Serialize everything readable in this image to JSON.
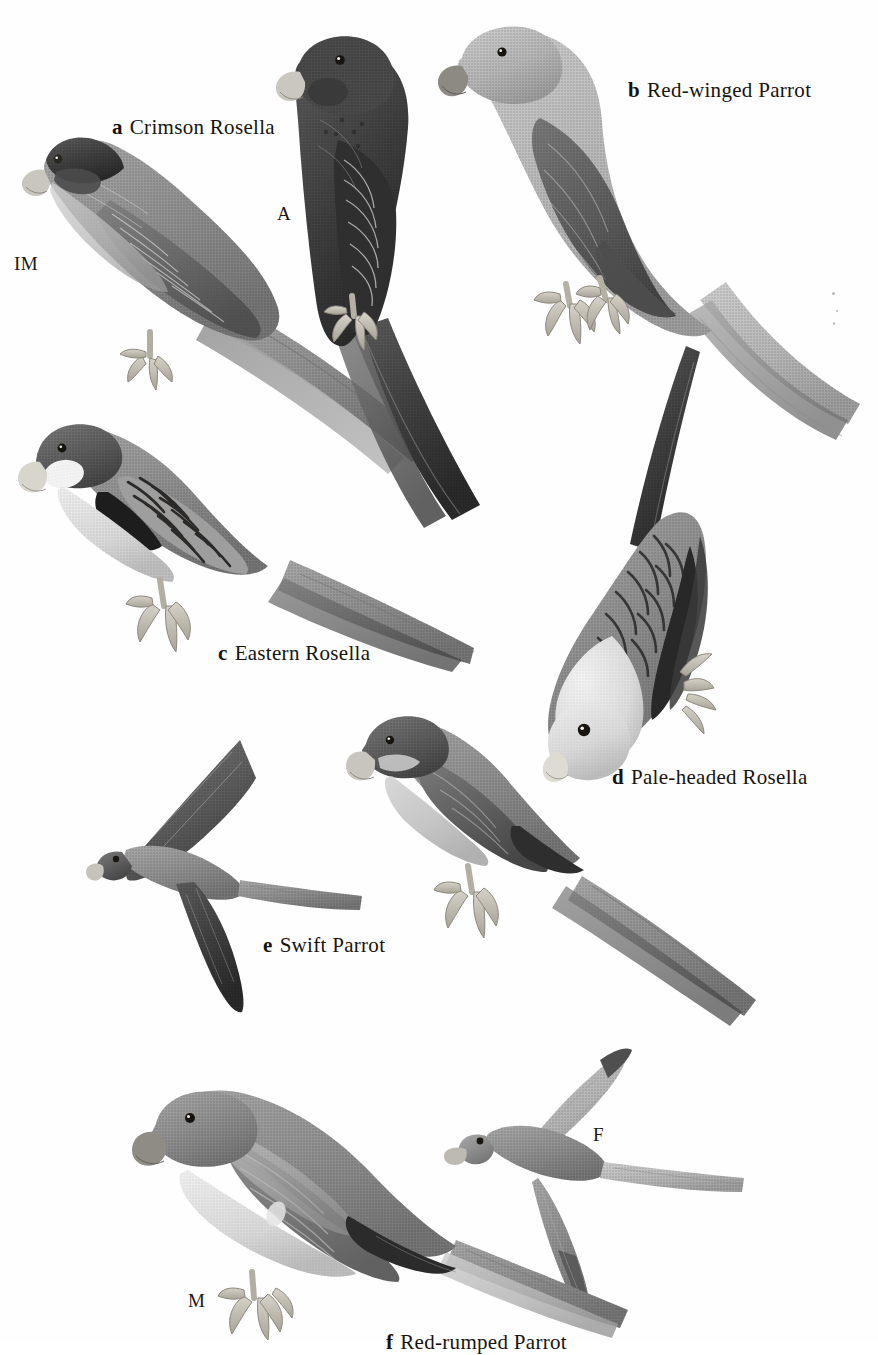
{
  "plate": {
    "kind": "field-guide-illustration-plate",
    "background_color": "#ffffff",
    "ink_color": "#16130f",
    "page_width": 878,
    "page_height": 1342,
    "style": "halftone grayscale scanned bird plate"
  },
  "species": [
    {
      "key": "a",
      "name": "Crimson Rosella",
      "label": "a  Crimson Rosella",
      "figures": [
        "IM",
        "A"
      ]
    },
    {
      "key": "b",
      "name": "Red-winged Parrot",
      "label": "b  Red-winged Parrot",
      "figures": []
    },
    {
      "key": "c",
      "name": "Eastern Rosella",
      "label": "c  Eastern Rosella",
      "figures": []
    },
    {
      "key": "d",
      "name": "Pale-headed Rosella",
      "label": "d  Pale-headed Rosella",
      "figures": []
    },
    {
      "key": "e",
      "name": "Swift Parrot",
      "label": "e  Swift Parrot",
      "figures": []
    },
    {
      "key": "f",
      "name": "Red-rumped Parrot",
      "label": "f  Red-rumped Parrot",
      "figures": [
        "M",
        "F"
      ]
    }
  ],
  "age_sex_labels": {
    "immature": "IM",
    "adult": "A",
    "female": "F",
    "male": "M"
  },
  "birds": [
    {
      "id": "crimson-rosella-immature",
      "species_key": "a",
      "tag": "IM",
      "posture": "perched-left-facing",
      "tone": "mid-gray"
    },
    {
      "id": "crimson-rosella-adult",
      "species_key": "a",
      "tag": "A",
      "posture": "perched-upright",
      "tone": "dark-gray"
    },
    {
      "id": "red-winged-parrot",
      "species_key": "b",
      "tag": "",
      "posture": "perched-upright",
      "tone": "light-gray"
    },
    {
      "id": "eastern-rosella",
      "species_key": "c",
      "tag": "",
      "posture": "perched-left-facing",
      "tone": "mid-dark"
    },
    {
      "id": "pale-headed-rosella",
      "species_key": "d",
      "tag": "",
      "posture": "clinging-head-down",
      "tone": "light-scaled"
    },
    {
      "id": "swift-parrot-flight",
      "species_key": "e",
      "tag": "",
      "posture": "in-flight",
      "tone": "dark-gray"
    },
    {
      "id": "swift-parrot-perched",
      "species_key": "e",
      "tag": "",
      "posture": "perched-left-facing",
      "tone": "mid-gray"
    },
    {
      "id": "red-rumped-parrot-female",
      "species_key": "f",
      "tag": "F",
      "posture": "in-flight",
      "tone": "light-gray"
    },
    {
      "id": "red-rumped-parrot-male",
      "species_key": "f",
      "tag": "M",
      "posture": "perched-left-facing",
      "tone": "mid-gray"
    }
  ]
}
